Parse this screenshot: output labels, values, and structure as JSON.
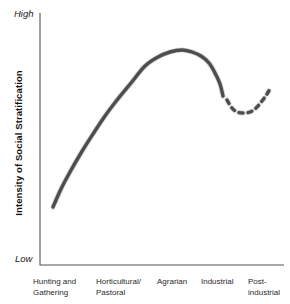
{
  "figure": {
    "high_label": "High",
    "low_label": "Low",
    "y_axis_title": "Intensity of Social Stratification"
  },
  "chart_data": {
    "type": "line",
    "title": "",
    "xlabel": "",
    "ylabel": "Intensity of Social Stratification",
    "y_scale_qualitative": [
      "Low",
      "High"
    ],
    "categories": [
      "Hunting and\nGathering",
      "Horticultural/\nPastoral",
      "Agrarian",
      "Industrial",
      "Post-\nindustrial"
    ],
    "grid": false,
    "legend": "none",
    "series": [
      {
        "name": "historical-trend",
        "style": "solid",
        "description": "Stratification rises from low in hunting-and-gathering societies, peaks in agrarian societies, then declines in industrial societies",
        "approx_values_0to1": [
          0.23,
          0.62,
          0.85,
          0.67
        ],
        "points_px": [
          [
            53,
            207
          ],
          [
            61,
            189
          ],
          [
            70,
            172
          ],
          [
            81,
            153
          ],
          [
            93,
            134
          ],
          [
            105,
            116
          ],
          [
            117,
            100
          ],
          [
            131,
            83
          ],
          [
            145,
            66
          ],
          [
            158,
            57
          ],
          [
            170,
            52
          ],
          [
            182,
            50
          ],
          [
            192,
            52
          ],
          [
            201,
            56
          ],
          [
            209,
            63
          ],
          [
            215,
            73
          ],
          [
            220,
            84
          ],
          [
            223,
            96
          ]
        ]
      },
      {
        "name": "postindustrial-projection",
        "style": "dashed",
        "description": "Dashed projection: slight further dip then uncertain rise in post-industrial societies",
        "approx_values_0to1": [
          0.66,
          0.61,
          0.71
        ],
        "points_px": [
          [
            227,
            100
          ],
          [
            232,
            108
          ],
          [
            237,
            112
          ],
          [
            243,
            113
          ],
          [
            250,
            112
          ],
          [
            256,
            108
          ],
          [
            262,
            101
          ],
          [
            267,
            94
          ],
          [
            271,
            87
          ]
        ]
      }
    ],
    "axes_px": {
      "origin": [
        40,
        265
      ],
      "y_top": 13,
      "x_right": 284
    },
    "colors": {
      "curve": "#4d4d4d",
      "curve_soft_edge": "#8a8a8a",
      "axis": "#555555",
      "text": "#1a1a1a",
      "background": "#ffffff"
    }
  }
}
